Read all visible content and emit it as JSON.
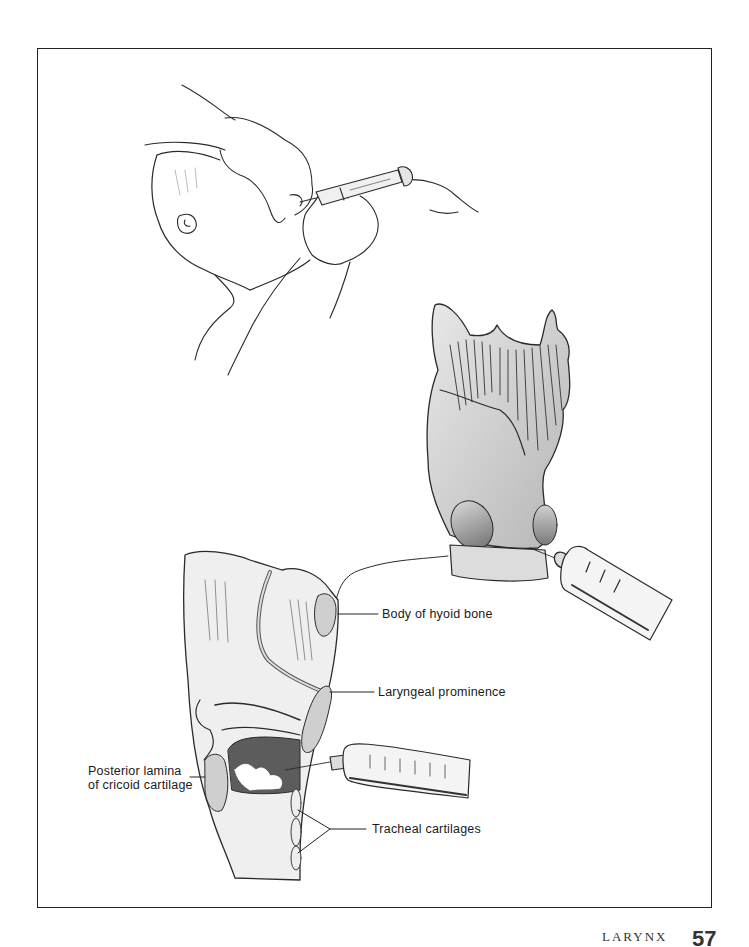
{
  "figure": {
    "panels": [
      {
        "id": "top",
        "description": "Gloved hands injecting syringe into the neck of a patient lying with head tilted back"
      },
      {
        "id": "right",
        "description": "External view of larynx (thyroid cartilage) with syringe needle inserted through the cricothyroid membrane"
      },
      {
        "id": "bottom",
        "description": "Sagittal section of larynx with syringe needle entering the airway"
      }
    ],
    "labels": {
      "hyoid": "Body of hyoid bone",
      "prominence": "Laryngeal prominence",
      "cricoid_line1": "Posterior lamina",
      "cricoid_line2": "of cricoid cartilage",
      "tracheal": "Tracheal cartilages"
    }
  },
  "footer": {
    "running_title": "LARYNX",
    "page_number": "57"
  }
}
